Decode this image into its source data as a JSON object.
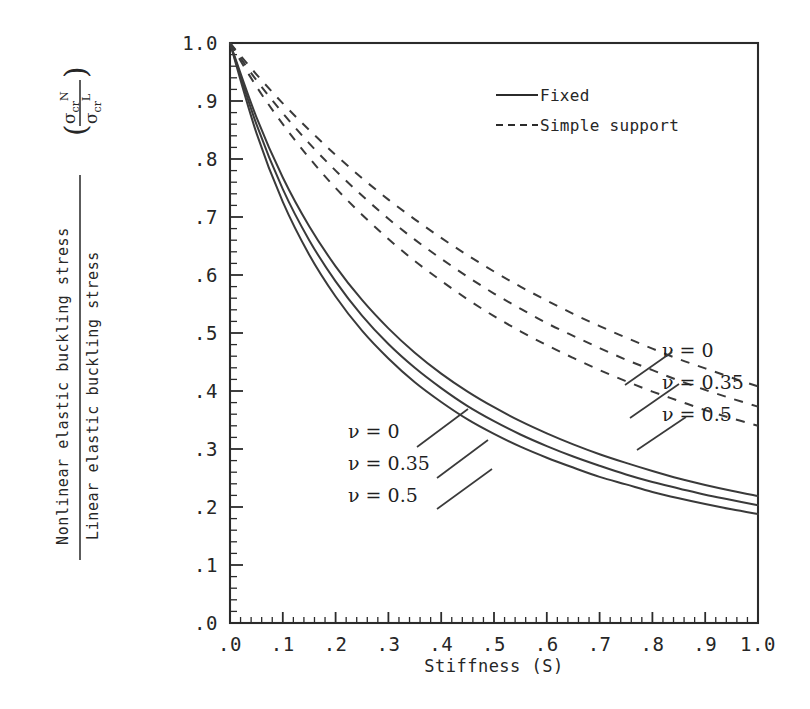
{
  "chart_data": {
    "type": "line",
    "title": "",
    "xlabel": "Stiffness (S)",
    "ylabel_numerator": "Nonlinear elastic buckling stress",
    "ylabel_denominator": "Linear elastic buckling stress",
    "ylabel_symbol_numerator": "σcr N",
    "ylabel_symbol_denominator": "σcr L",
    "xlim": [
      0.0,
      1.0
    ],
    "ylim": [
      0.0,
      1.0
    ],
    "xticks": [
      ".0",
      ".1",
      ".2",
      ".3",
      ".4",
      ".5",
      ".6",
      ".7",
      ".8",
      ".9",
      "1.0"
    ],
    "yticks": [
      ".0",
      ".1",
      ".2",
      ".3",
      ".4",
      ".5",
      ".6",
      ".7",
      ".8",
      ".9",
      "1.0"
    ],
    "xtick_values": [
      0.0,
      0.1,
      0.2,
      0.3,
      0.4,
      0.5,
      0.6,
      0.7,
      0.8,
      0.9,
      1.0
    ],
    "ytick_values": [
      0.0,
      0.1,
      0.2,
      0.3,
      0.4,
      0.5,
      0.6,
      0.7,
      0.8,
      0.9,
      1.0
    ],
    "minor_ticks_per_major": 5,
    "grid": false,
    "legend_position": "upper-right-inside",
    "x": [
      0.0,
      0.05,
      0.1,
      0.15,
      0.2,
      0.25,
      0.3,
      0.35,
      0.4,
      0.45,
      0.5,
      0.55,
      0.6,
      0.65,
      0.7,
      0.75,
      0.8,
      0.85,
      0.9,
      0.95,
      1.0
    ],
    "series": [
      {
        "name": "Fixed, ν = 0",
        "style": "solid",
        "group": "Fixed",
        "nu": "0",
        "values": [
          1.0,
          0.872,
          0.768,
          0.684,
          0.615,
          0.557,
          0.508,
          0.466,
          0.43,
          0.399,
          0.372,
          0.348,
          0.327,
          0.308,
          0.291,
          0.276,
          0.262,
          0.249,
          0.238,
          0.228,
          0.219
        ]
      },
      {
        "name": "Fixed, ν = 0.35",
        "style": "solid",
        "group": "Fixed",
        "nu": "0.35",
        "values": [
          1.0,
          0.86,
          0.748,
          0.66,
          0.589,
          0.53,
          0.481,
          0.44,
          0.405,
          0.374,
          0.348,
          0.325,
          0.305,
          0.287,
          0.271,
          0.256,
          0.243,
          0.232,
          0.221,
          0.212,
          0.203
        ]
      },
      {
        "name": "Fixed, ν = 0.5",
        "style": "solid",
        "group": "Fixed",
        "nu": "0.5",
        "values": [
          1.0,
          0.845,
          0.726,
          0.635,
          0.563,
          0.504,
          0.456,
          0.415,
          0.381,
          0.351,
          0.326,
          0.304,
          0.285,
          0.268,
          0.252,
          0.239,
          0.226,
          0.215,
          0.205,
          0.196,
          0.188
        ]
      },
      {
        "name": "Simple support, ν = 0",
        "style": "dashed",
        "group": "Simple support",
        "nu": "0",
        "values": [
          1.0,
          0.946,
          0.896,
          0.85,
          0.807,
          0.767,
          0.73,
          0.696,
          0.664,
          0.634,
          0.606,
          0.58,
          0.556,
          0.533,
          0.512,
          0.492,
          0.473,
          0.455,
          0.439,
          0.423,
          0.408
        ]
      },
      {
        "name": "Simple support, ν = 0.35",
        "style": "dashed",
        "group": "Simple support",
        "nu": "0.35",
        "values": [
          1.0,
          0.936,
          0.879,
          0.827,
          0.78,
          0.737,
          0.697,
          0.661,
          0.628,
          0.597,
          0.568,
          0.542,
          0.517,
          0.495,
          0.474,
          0.454,
          0.436,
          0.418,
          0.402,
          0.387,
          0.373
        ]
      },
      {
        "name": "Simple support, ν = 0.5",
        "style": "dashed",
        "group": "Simple support",
        "nu": "0.5",
        "values": [
          1.0,
          0.925,
          0.86,
          0.802,
          0.75,
          0.704,
          0.662,
          0.624,
          0.59,
          0.558,
          0.529,
          0.503,
          0.479,
          0.457,
          0.436,
          0.417,
          0.399,
          0.383,
          0.367,
          0.353,
          0.34
        ]
      }
    ],
    "legend": [
      {
        "label": "Fixed",
        "style": "solid"
      },
      {
        "label": "Simple support",
        "style": "dashed"
      }
    ],
    "annotations": [
      {
        "text": "ν = 0",
        "group": "Fixed",
        "x": 0.3,
        "y": 0.315
      },
      {
        "text": "ν = 0.35",
        "group": "Fixed",
        "x": 0.3,
        "y": 0.272
      },
      {
        "text": "ν = 0.5",
        "group": "Fixed",
        "x": 0.3,
        "y": 0.228
      },
      {
        "text": "ν = 0",
        "group": "Simple support",
        "x": 0.855,
        "y": 0.495
      },
      {
        "text": "ν = 0.35",
        "group": "Simple support",
        "x": 0.855,
        "y": 0.45
      },
      {
        "text": "ν = 0.5",
        "group": "Simple support",
        "x": 0.855,
        "y": 0.405
      }
    ]
  },
  "labels": {
    "nu_0": "ν = 0",
    "nu_035": "ν = 0.35",
    "nu_05": "ν = 0.5",
    "legend_fixed": "Fixed",
    "legend_simple": "Simple support",
    "xaxis_title": "Stiffness (S)",
    "y_numerator": "Nonlinear elastic buckling stress",
    "y_denominator": "Linear elastic buckling stress",
    "sym_num_base": "σ",
    "sym_num_sub": "cr",
    "sym_num_sup": "N",
    "sym_den_base": "σ",
    "sym_den_sub": "cr",
    "sym_den_sup": "L",
    "paren_open": "(",
    "paren_close": ")"
  },
  "xticklabels": [
    ".0",
    ".1",
    ".2",
    ".3",
    ".4",
    ".5",
    ".6",
    ".7",
    ".8",
    ".9",
    "1.0"
  ],
  "yticklabels": [
    ".0",
    ".1",
    ".2",
    ".3",
    ".4",
    ".5",
    ".6",
    ".7",
    ".8",
    ".9",
    "1.0"
  ],
  "colors": {
    "ink": "#2b2b2b",
    "curve": "#3a3a3a",
    "background": "#ffffff"
  }
}
